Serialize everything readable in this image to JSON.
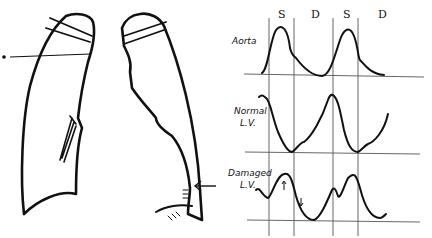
{
  "figure": {
    "left_panel": {
      "description": "Outline drawing of left and right lung fields with pointer lines",
      "pointer_top_left": "pointer line at left apex",
      "pointer_bottom_right": "arrow pointing to lower right cardiac border"
    },
    "right_panel": {
      "phase_labels": [
        "S",
        "D",
        "S",
        "D"
      ],
      "traces": [
        {
          "label": "Aorta"
        },
        {
          "label": "Normal",
          "label2": "L.V."
        },
        {
          "label": "Damaged",
          "label2": "L.V."
        }
      ]
    }
  },
  "colors": {
    "ink": "#111111",
    "grid": "#555555",
    "background": "#ffffff"
  }
}
